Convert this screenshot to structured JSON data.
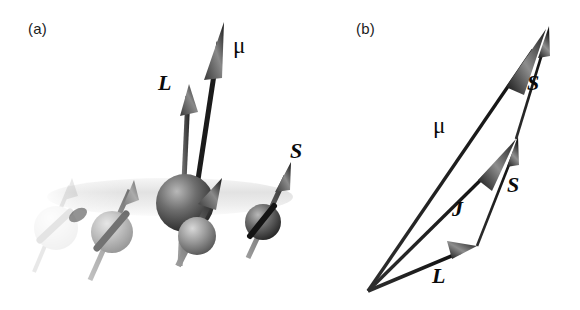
{
  "figure": {
    "type": "two-panel scientific illustration",
    "background_color": "#ffffff",
    "ink_color": "#0a0a0a"
  },
  "panel_a": {
    "label": "(a)",
    "label_pos": [
      28,
      20
    ],
    "description": "3D rendering of a chain of atoms on a faded cylindrical tube, each atom carrying a tilted spin arrow; the central large atom additionally shows orbital moment L and total magnetic moment mu",
    "tube": {
      "x": 48,
      "y": 178,
      "width": 245,
      "height": 38,
      "color": "#ebebeb"
    },
    "atoms": [
      {
        "name": "atom-1",
        "cx": 56,
        "cy": 228,
        "r": 22,
        "opacity": 0.12,
        "shade": "#9a9a9a"
      },
      {
        "name": "atom-2",
        "cx": 112,
        "cy": 232,
        "r": 21,
        "opacity": 0.55,
        "shade": "#8d8d8d"
      },
      {
        "name": "atom-3",
        "cx": 185,
        "cy": 203,
        "r": 29,
        "opacity": 1.0,
        "shade": "#4a4a4a"
      },
      {
        "name": "atom-3-front",
        "cx": 196,
        "cy": 236,
        "r": 19,
        "opacity": 1.0,
        "shade": "#8a8a8a"
      },
      {
        "name": "atom-4",
        "cx": 263,
        "cy": 222,
        "r": 18,
        "opacity": 1.0,
        "shade": "#5a5a5a"
      }
    ],
    "spin_arrows": [
      {
        "name": "spin-arrow-1",
        "x1": 32,
        "y1": 272,
        "x2": 72,
        "y2": 182,
        "opacity": 0.14
      },
      {
        "name": "spin-arrow-2",
        "x1": 88,
        "y1": 280,
        "x2": 134,
        "y2": 184,
        "opacity": 0.85
      },
      {
        "name": "spin-arrow-3",
        "x1": 176,
        "y1": 268,
        "x2": 222,
        "y2": 180,
        "opacity": 1.0
      },
      {
        "name": "spin-arrow-4",
        "x1": 246,
        "y1": 258,
        "x2": 290,
        "y2": 168,
        "opacity": 1.0
      }
    ],
    "vectors": [
      {
        "name": "L",
        "label": "L",
        "x1": 178,
        "y1": 268,
        "x2": 188,
        "y2": 86,
        "label_pos": [
          160,
          82
        ]
      },
      {
        "name": "mu",
        "label": "μ",
        "x1": 188,
        "y1": 230,
        "x2": 224,
        "y2": 24,
        "label_pos": [
          234,
          36
        ]
      }
    ],
    "labels": [
      {
        "name": "label-L",
        "text": "L",
        "x": 160,
        "y": 82
      },
      {
        "name": "label-mu",
        "text": "μ",
        "x": 234,
        "y": 36
      },
      {
        "name": "label-S",
        "text": "S",
        "x": 291,
        "y": 148
      }
    ]
  },
  "panel_b": {
    "label": "(b)",
    "label_pos": [
      356,
      20
    ],
    "description": "Vector addition diagram: L + S = J, and J + S = mu, all drawn from a common origin",
    "origin": [
      368,
      291
    ],
    "vectors": [
      {
        "name": "L",
        "label": "L",
        "x1": 368,
        "y1": 291,
        "x2": 476,
        "y2": 247,
        "label_pos": [
          433,
          272
        ]
      },
      {
        "name": "J",
        "label": "J",
        "x1": 368,
        "y1": 291,
        "x2": 516,
        "y2": 139,
        "label_pos": [
          452,
          208
        ]
      },
      {
        "name": "mu",
        "label": "μ",
        "x1": 368,
        "y1": 291,
        "x2": 546,
        "y2": 30,
        "label_pos": [
          434,
          116
        ]
      },
      {
        "name": "S-lower",
        "label": "S",
        "x1": 476,
        "y1": 247,
        "x2": 519,
        "y2": 135,
        "label_pos": [
          508,
          182
        ]
      },
      {
        "name": "S-upper",
        "label": "S",
        "x1": 516,
        "y1": 139,
        "x2": 549,
        "y2": 26,
        "label_pos": [
          528,
          80
        ]
      }
    ],
    "labels": [
      {
        "name": "label-mu",
        "text": "μ",
        "x": 434,
        "y": 116
      },
      {
        "name": "label-J",
        "text": "J",
        "x": 452,
        "y": 208
      },
      {
        "name": "label-L",
        "text": "L",
        "x": 433,
        "y": 272
      },
      {
        "name": "label-S-lower",
        "text": "S",
        "x": 508,
        "y": 182
      },
      {
        "name": "label-S-upper",
        "text": "S",
        "x": 528,
        "y": 80
      }
    ]
  }
}
